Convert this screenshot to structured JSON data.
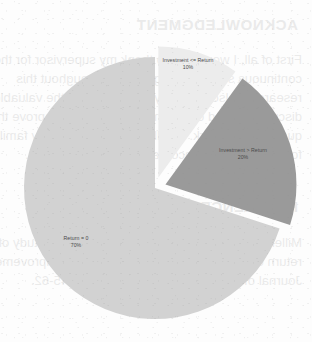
{
  "chart_data": {
    "type": "pie",
    "title": "",
    "subtitle": "",
    "xlabel": "",
    "ylabel": "",
    "legend_position": "none",
    "grid": false,
    "exploded": true,
    "categories": [
      "Investment <= Return",
      "Investment > Return",
      "Return = 0"
    ],
    "values": [
      10,
      20,
      70
    ],
    "unit": "%",
    "slices": [
      {
        "label": "Investment <= Return",
        "percent_text": "10%",
        "value": 10,
        "color": "#ececec",
        "start_angle_deg": 324,
        "end_angle_deg": 360,
        "exploded": true
      },
      {
        "label": "Investment > Return",
        "percent_text": "20%",
        "value": 20,
        "color": "#9a9a9a",
        "start_angle_deg": 0,
        "end_angle_deg": 72,
        "exploded": true
      },
      {
        "label": "Return = 0",
        "percent_text": "70%",
        "value": 70,
        "color": "#d2d2d2",
        "start_angle_deg": 72,
        "end_angle_deg": 324,
        "exploded": false
      }
    ]
  },
  "colors": {
    "page_background": "#fdfdfd",
    "slice_light": "#ececec",
    "slice_dark": "#9a9a9a",
    "slice_medium": "#d2d2d2",
    "label_text": "#4a4a4a"
  },
  "bleed_through": {
    "heading_acknowledgment": "ACKNOWLEDGMENT",
    "heading_references": "REFERENCES",
    "paragraph_lines": [
      "First of all, I would like to thank my supervisor for the",
      "continuous support and guidance throughout this",
      "research. I also thank my colleagues for the valuable",
      "discussions and comments which helped improve the",
      "quality of this work. Finally, I am grateful to my family",
      "for their constant encouragement and patience."
    ],
    "reference_lines": [
      "Miller, J. and Smith, R. (2004). An empirical study of",
      "return on investment in software process improvement.",
      "Journal of Software Engineering, 12(3), 45-62."
    ]
  }
}
